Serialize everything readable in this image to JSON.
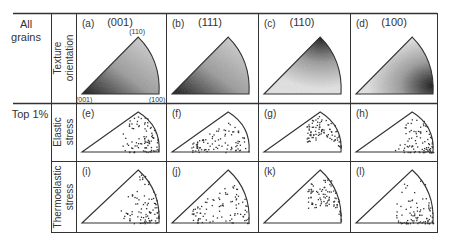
{
  "row_labels": {
    "all_grains": [
      "All",
      "grains"
    ],
    "top1": "Top 1%"
  },
  "sub_labels": {
    "texture": [
      "Texture",
      "orientation"
    ],
    "elastic": [
      "Elastic",
      "stress"
    ],
    "thermo": [
      "Thermoelastic",
      "stress"
    ]
  },
  "columns": [
    {
      "header": "(001)",
      "panels": [
        "(a)",
        "(e)",
        "(i)"
      ],
      "shade": "left"
    },
    {
      "header": "(111)",
      "panels": [
        "(b)",
        "(f)",
        "(j)"
      ],
      "shade": "left"
    },
    {
      "header": "(110)",
      "panels": [
        "(c)",
        "(g)",
        "(k)"
      ],
      "shade": "apex"
    },
    {
      "header": "(100)",
      "panels": [
        "(d)",
        "(h)",
        "(l)"
      ],
      "shade": "right"
    }
  ],
  "corner_labels": {
    "bottom_left": "(001)",
    "bottom_right": "(100)",
    "apex": "(110)"
  },
  "colors": {
    "line": "#333333",
    "dark": "#1a1a1a",
    "light": "#e8e8e8"
  }
}
